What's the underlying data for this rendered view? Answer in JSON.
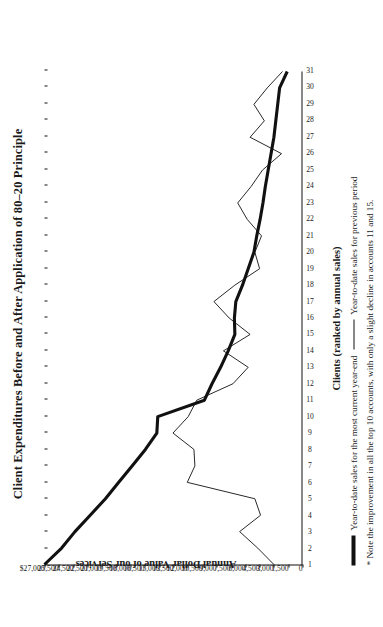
{
  "title": "Client Expenditures Before and After Application of 80–20 Principle",
  "axes": {
    "x_title": "Clients (ranked by annual sales)",
    "y_title": "Annual Dollar Value of our Services",
    "y_ticks": [
      "$27,000",
      "25,500",
      "24,500",
      "22,500",
      "21,000",
      "19,500",
      "18,000",
      "16,500",
      "15,000",
      "13,500",
      "12,000",
      "10,500",
      "9,000",
      "7,500",
      "6,000",
      "4,500",
      "3,000",
      "1,500",
      "0"
    ],
    "x_ticks": [
      "1",
      "2",
      "3",
      "4",
      "5",
      "6",
      "7",
      "8",
      "9",
      "10",
      "11",
      "12",
      "13",
      "14",
      "15",
      "16",
      "17",
      "18",
      "19",
      "20",
      "21",
      "22",
      "23",
      "24",
      "25",
      "26",
      "27",
      "28",
      "29",
      "30",
      "31"
    ]
  },
  "legend": {
    "current_label": "Year-to-date sales for the most current year-end",
    "previous_label": "Year-to-date sales for previous period"
  },
  "footnote": "* Note the improvement in all the top 10 accounts, with only a slight decline in accounts 11 and 15.",
  "chart_data": {
    "type": "line",
    "title": "Client Expenditures Before and After Application of 80–20 Principle",
    "xlabel": "Clients (ranked by annual sales)",
    "ylabel": "Annual Dollar Value of our Services",
    "xlim": [
      1,
      31
    ],
    "ylim": [
      0,
      27000
    ],
    "grid": false,
    "legend_position": "below-plot",
    "x": [
      1,
      2,
      3,
      4,
      5,
      6,
      7,
      8,
      9,
      10,
      11,
      12,
      13,
      14,
      15,
      16,
      17,
      18,
      19,
      20,
      21,
      22,
      23,
      24,
      25,
      26,
      27,
      28,
      29,
      30,
      31
    ],
    "series": [
      {
        "name": "Year-to-date sales for the most current year-end",
        "style": "thick",
        "values": [
          27000,
          25200,
          23800,
          22200,
          20600,
          19200,
          17800,
          16400,
          15200,
          15100,
          10200,
          9400,
          8500,
          7700,
          7000,
          7050,
          6900,
          6200,
          5600,
          5000,
          4700,
          4350,
          4050,
          3800,
          3500,
          3200,
          2900,
          2700,
          2500,
          2300,
          1500
        ]
      },
      {
        "name": "Year-to-date sales for previous period",
        "style": "thin",
        "values": [
          2900,
          4600,
          6500,
          4300,
          4900,
          12000,
          11200,
          11300,
          13500,
          11900,
          11000,
          7200,
          5600,
          8200,
          5400,
          7600,
          9200,
          7000,
          4400,
          4900,
          4200,
          5700,
          6700,
          5300,
          4100,
          2100,
          5400,
          3900,
          5000,
          3600,
          2000
        ]
      }
    ]
  }
}
